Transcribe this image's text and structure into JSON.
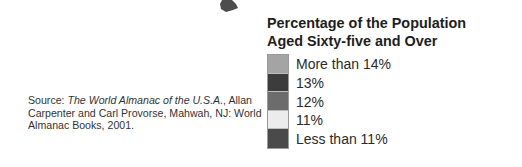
{
  "map_fragment": {
    "description": "partial dark shape of map region at top edge",
    "color": "#3a3a3a"
  },
  "source": {
    "prefix": "Source: ",
    "title_italic": "The World Almanac of the U.S.A.",
    "rest": ", Allan Carpenter and Carl Provorse, Mahwah, NJ: World Almanac Books, 2001."
  },
  "legend": {
    "title_line1": "Percentage of the Population",
    "title_line2": "Aged Sixty-five and Over",
    "items": [
      {
        "label": "More than 14%",
        "color": "#a4a4a4"
      },
      {
        "label": "13%",
        "color": "#3c3c3c"
      },
      {
        "label": "12%",
        "color": "#6c6c6c"
      },
      {
        "label": "11%",
        "color": "#ececec"
      },
      {
        "label": "Less than 11%",
        "color": "#4a4a4a"
      }
    ]
  }
}
